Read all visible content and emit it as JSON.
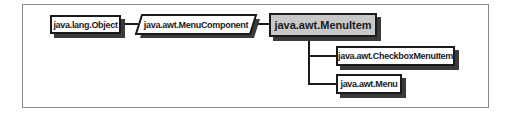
{
  "diagram": {
    "type": "class-hierarchy",
    "nodes": {
      "object": {
        "label": "java.lang.Object",
        "kind": "class"
      },
      "menu_component": {
        "label": "java.awt.MenuComponent",
        "kind": "abstract-class"
      },
      "menu_item": {
        "label": "java.awt.MenuItem",
        "kind": "class",
        "highlighted": true
      },
      "checkbox_menu_item": {
        "label": "java.awt.CheckboxMenuItem",
        "kind": "class"
      },
      "menu": {
        "label": "java.awt.Menu",
        "kind": "class"
      }
    },
    "edges": [
      {
        "from": "java.lang.Object",
        "to": "java.awt.MenuComponent"
      },
      {
        "from": "java.awt.MenuComponent",
        "to": "java.awt.MenuItem"
      },
      {
        "from": "java.awt.MenuItem",
        "to": "java.awt.CheckboxMenuItem"
      },
      {
        "from": "java.awt.MenuItem",
        "to": "java.awt.Menu"
      }
    ],
    "colors": {
      "border": "#1a1a1a",
      "shadow": "#3a3a3a",
      "highlight_fill": "#c8c8c8",
      "frame": "#8a8a8a"
    }
  }
}
